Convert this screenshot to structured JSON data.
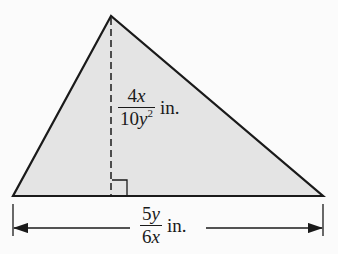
{
  "diagram": {
    "type": "triangle",
    "fill_color": "#e4e4e4",
    "stroke_color": "#1a1a1a",
    "vertices": {
      "apex": [
        111,
        16
      ],
      "base_left": [
        13,
        196
      ],
      "base_right": [
        323,
        196
      ]
    },
    "height_line": {
      "style": "dashed",
      "x": 111,
      "from_y": 16,
      "to_y": 196
    },
    "right_angle_marker": true,
    "height_label": {
      "numerator_coef": "4",
      "numerator_var": "x",
      "denominator_coef": "10",
      "denominator_var": "y",
      "denominator_exp": "2",
      "unit": "in."
    },
    "base_label": {
      "numerator_coef": "5",
      "numerator_var": "y",
      "denominator_coef": "6",
      "denominator_var": "x",
      "unit": "in."
    },
    "dimension_line": {
      "y": 228,
      "arrows": "both"
    }
  }
}
